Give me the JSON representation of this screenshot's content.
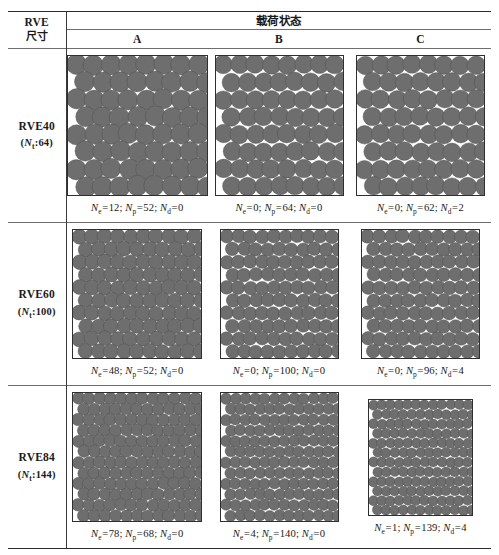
{
  "figure": {
    "type": "table",
    "header": {
      "left_line1": "RVE",
      "left_line2": "尺寸",
      "span_label": "载荷状态",
      "columns": [
        "A",
        "B",
        "C"
      ]
    },
    "rows": [
      {
        "label": "RVE40",
        "sub_prefix": "(",
        "sub_symbol": "N",
        "sub_subscript": "t",
        "sub_sep": ":",
        "sub_value": "64",
        "sub_suffix": ")",
        "grid": 8,
        "cells": [
          {
            "column": "A",
            "caption": "Ne=12; Np=52; Nd=0",
            "values": {
              "Ne": 12,
              "Np": 52,
              "Nd": 0
            },
            "pattern": "stagger-8"
          },
          {
            "column": "B",
            "caption": "Ne=0; Np=64; Nd=0",
            "values": {
              "Ne": 0,
              "Np": 64,
              "Nd": 0
            },
            "pattern": "stagger-8"
          },
          {
            "column": "C",
            "caption": "Ne=0; Np=62; Nd=2",
            "values": {
              "Ne": 0,
              "Np": 62,
              "Nd": 2
            },
            "pattern": "stagger-8"
          }
        ]
      },
      {
        "label": "RVE60",
        "sub_prefix": "(",
        "sub_symbol": "N",
        "sub_subscript": "t",
        "sub_sep": ":",
        "sub_value": "100",
        "sub_suffix": ")",
        "grid": 10,
        "cells": [
          {
            "column": "A",
            "caption": "Ne=48; Np=52; Nd=0",
            "values": {
              "Ne": 48,
              "Np": 52,
              "Nd": 0
            },
            "pattern": "stagger-10"
          },
          {
            "column": "B",
            "caption": "Ne=0; Np=100; Nd=0",
            "values": {
              "Ne": 0,
              "Np": 100,
              "Nd": 0
            },
            "pattern": "stagger-10"
          },
          {
            "column": "C",
            "caption": "Ne=0; Np=96; Nd=4",
            "values": {
              "Ne": 0,
              "Np": 96,
              "Nd": 4
            },
            "pattern": "stagger-10"
          }
        ]
      },
      {
        "label": "RVE84",
        "sub_prefix": "(",
        "sub_symbol": "N",
        "sub_subscript": "t",
        "sub_sep": ":",
        "sub_value": "144",
        "sub_suffix": ")",
        "grid": 12,
        "cells": [
          {
            "column": "A",
            "caption": "Ne=78; Np=68; Nd=0",
            "values": {
              "Ne": 78,
              "Np": 68,
              "Nd": 0
            },
            "pattern": "stagger-12"
          },
          {
            "column": "B",
            "caption": "Ne=4; Np=140; Nd=0",
            "values": {
              "Ne": 4,
              "Np": 140,
              "Nd": 0
            },
            "pattern": "stagger-12"
          },
          {
            "column": "C",
            "caption": "Ne=1; Np=139; Nd=4",
            "values": {
              "Ne": 1,
              "Np": 139,
              "Nd": 4
            },
            "pattern": "stagger-12"
          }
        ]
      }
    ],
    "symbols": {
      "Ne": {
        "symbol": "N",
        "subscript": "e"
      },
      "Np": {
        "symbol": "N",
        "subscript": "p"
      },
      "Nd": {
        "symbol": "N",
        "subscript": "d"
      }
    },
    "colors": {
      "fiber_fill": "#6e6e6e",
      "fiber_stroke": "#4a4a4a",
      "matrix_bg": "#ffffff",
      "box_border": "#2f2f2f",
      "rule_heavy": "#2b2b2b",
      "rule_light": "#6e6e6e"
    }
  }
}
